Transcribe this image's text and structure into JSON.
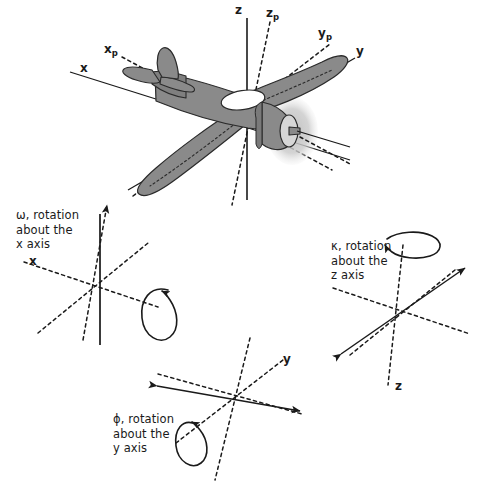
{
  "figure": {
    "background_color": "#ffffff",
    "ink_color": "#1a1a1a",
    "aircraft": {
      "body_fill": "#8a8a8a",
      "body_fill_dark": "#6f6f6f",
      "body_fill_light": "#9a9a9a",
      "canopy_fill": "#ffffff",
      "prop_disc_fill": "#cfcfcf",
      "outline_color": "#2a2a2a"
    }
  },
  "main_diagram": {
    "axis_labels": [
      {
        "id": "x",
        "text": "x",
        "sub": "",
        "x": 84,
        "y": 68
      },
      {
        "id": "xp",
        "text": "x",
        "sub": "p",
        "x": 108,
        "y": 48
      },
      {
        "id": "z",
        "text": "z",
        "sub": "",
        "x": 238,
        "y": 8
      },
      {
        "id": "zp",
        "text": "z",
        "sub": "p",
        "x": 268,
        "y": 11
      },
      {
        "id": "yp",
        "text": "y",
        "sub": "p",
        "x": 322,
        "y": 31
      },
      {
        "id": "y",
        "text": "y",
        "sub": "",
        "x": 359,
        "y": 49
      }
    ]
  },
  "rotations": [
    {
      "id": "omega",
      "symbol": "ω",
      "caption_lines": [
        "ω, rotation",
        "about the",
        "x axis"
      ],
      "axis_label": "x",
      "caption_x": 16,
      "caption_y": 207,
      "axis_label_x": 30,
      "axis_label_y": 255
    },
    {
      "id": "kappa",
      "symbol": "κ",
      "caption_lines": [
        "κ, rotation",
        "about the",
        "z axis"
      ],
      "axis_label": "z",
      "caption_x": 330,
      "caption_y": 238,
      "axis_label_x": 394,
      "axis_label_y": 385
    },
    {
      "id": "phi",
      "symbol": "ϕ",
      "caption_lines": [
        "ϕ, rotation",
        "about the",
        "y axis"
      ],
      "axis_label": "y",
      "caption_x": 112,
      "caption_y": 411,
      "axis_label_x": 283,
      "axis_label_y": 357
    }
  ]
}
